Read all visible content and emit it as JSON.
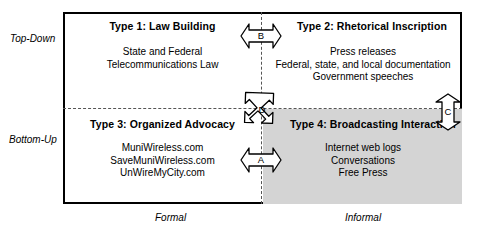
{
  "axes": {
    "vertical_top": "Top-Down",
    "vertical_bottom": "Bottom-Up",
    "horizontal_left": "Formal",
    "horizontal_right": "Informal"
  },
  "quadrants": [
    {
      "id": "type-1",
      "title": "Type 1:  Law Building",
      "lines": [
        "State and Federal",
        "Telecommunications Law"
      ]
    },
    {
      "id": "type-2",
      "title": "Type 2:  Rhetorical Inscription",
      "lines": [
        "Press releases",
        "Federal, state, and local documentation",
        "Government speeches"
      ]
    },
    {
      "id": "type-3",
      "title": "Type 3:  Organized Advocacy",
      "lines": [
        "MuniWireless.com",
        "SaveMuniWireless.com",
        "UnWireMyCity.com"
      ]
    },
    {
      "id": "type-4",
      "title": "Type 4:  Broadcasting Interaction",
      "lines": [
        "Internet web logs",
        "Conversations",
        "Free Press"
      ]
    }
  ],
  "markers": [
    {
      "id": "marker-a",
      "label": "A",
      "orientation": "horizontal-double"
    },
    {
      "id": "marker-b",
      "label": "B",
      "orientation": "horizontal-double"
    },
    {
      "id": "marker-c",
      "label": "C",
      "orientation": "vertical-double"
    },
    {
      "id": "marker-d",
      "label": "D",
      "orientation": "diagonal-quad"
    }
  ],
  "colors": {
    "shading": "#d4d4d4",
    "frame": "#000000",
    "divider": "#555555"
  }
}
